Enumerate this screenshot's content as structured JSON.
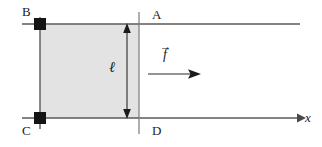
{
  "figure": {
    "background_color": "#ffffff",
    "line_color": "#555555",
    "ink_color": "#1b1b1b",
    "shade_color": "#e2e2e2",
    "width": 322,
    "height": 147
  },
  "labels": {
    "corner_top_left": "B",
    "corner_top_right": "A",
    "corner_bottom_left": "C",
    "corner_bottom_right": "D",
    "length": "ℓ",
    "force_symbol": "f",
    "force_vector_accent": "→",
    "axis_x": "x"
  },
  "geometry": {
    "top_rail": {
      "x1": 22,
      "y": 24,
      "x2": 300
    },
    "bottom_rail": {
      "x1": 22,
      "y": 118,
      "x2": 300,
      "arrow": true
    },
    "bar_bc": {
      "x": 40,
      "y1": 17,
      "y2": 129
    },
    "line_ad": {
      "x": 139,
      "y1": 12,
      "y2": 134
    },
    "shaded_region": {
      "x": 40,
      "y": 24,
      "width": 99,
      "height": 94
    },
    "contact_squares": [
      {
        "cx": 40,
        "cy": 24,
        "size": 12
      },
      {
        "cx": 40,
        "cy": 118,
        "size": 12
      }
    ],
    "length_arrow": {
      "x": 127,
      "y1": 24,
      "y2": 118,
      "double_headed": true
    },
    "force_arrow": {
      "x1": 148,
      "x2": 201,
      "y": 74
    }
  },
  "annotations": {
    "length_meaning": "ℓ marks the separation between the two rails",
    "force_meaning": "f⃗ is the applied force directed along +x"
  }
}
